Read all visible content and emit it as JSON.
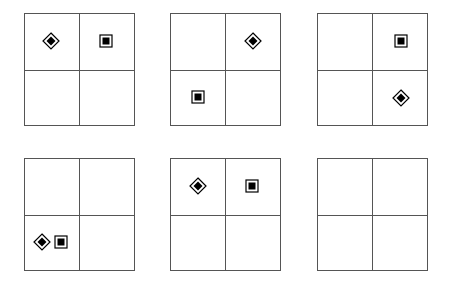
{
  "diagram": {
    "colors": {
      "line": "#555555",
      "fill": "#000000",
      "background": "#ffffff"
    },
    "symbol_types": [
      "diamond-in-diamond",
      "square-in-square"
    ],
    "panels": [
      {
        "id": 1,
        "row": 0,
        "col": 0,
        "left": 24,
        "top": 13,
        "symbols": [
          {
            "type": "diamond",
            "cx": 51,
            "cy": 41,
            "cell": "top-left"
          },
          {
            "type": "square",
            "cx": 106,
            "cy": 41,
            "cell": "top-right"
          }
        ]
      },
      {
        "id": 2,
        "row": 0,
        "col": 1,
        "left": 170,
        "top": 13,
        "symbols": [
          {
            "type": "diamond",
            "cx": 253,
            "cy": 41,
            "cell": "top-right"
          },
          {
            "type": "square",
            "cx": 198,
            "cy": 97,
            "cell": "bottom-left"
          }
        ]
      },
      {
        "id": 3,
        "row": 0,
        "col": 2,
        "left": 317,
        "top": 13,
        "symbols": [
          {
            "type": "square",
            "cx": 401,
            "cy": 41,
            "cell": "top-right"
          },
          {
            "type": "diamond",
            "cx": 401,
            "cy": 98,
            "cell": "bottom-right"
          }
        ]
      },
      {
        "id": 4,
        "row": 1,
        "col": 0,
        "left": 24,
        "top": 158,
        "symbols": [
          {
            "type": "diamond",
            "cx": 42,
            "cy": 242,
            "cell": "bottom-left"
          },
          {
            "type": "square",
            "cx": 61,
            "cy": 242,
            "cell": "bottom-left"
          }
        ]
      },
      {
        "id": 5,
        "row": 1,
        "col": 1,
        "left": 170,
        "top": 158,
        "symbols": [
          {
            "type": "diamond",
            "cx": 198,
            "cy": 186,
            "cell": "top-left"
          },
          {
            "type": "square",
            "cx": 252,
            "cy": 186,
            "cell": "top-right"
          }
        ]
      },
      {
        "id": 6,
        "row": 1,
        "col": 2,
        "left": 317,
        "top": 158,
        "symbols": []
      }
    ]
  }
}
